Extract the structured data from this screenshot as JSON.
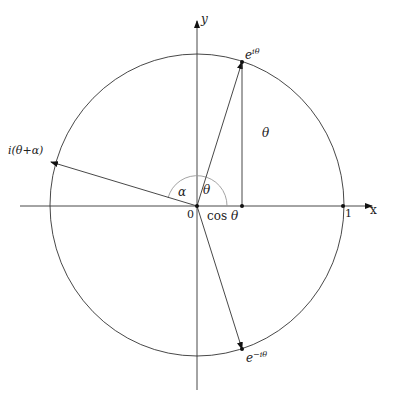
{
  "diagram": {
    "type": "unit-circle-complex-plane",
    "colors": {
      "stroke": "#333333",
      "arc": "#999999",
      "background": "#ffffff"
    },
    "axes": {
      "x_label": "x",
      "y_label": "y",
      "origin_label": "0",
      "unit_label": "1"
    },
    "points": {
      "e_i_theta": {
        "base": "e",
        "exp": "iθ"
      },
      "e_minus_i_theta": {
        "base": "e",
        "exp": "−iθ"
      },
      "i_theta_alpha": "i(θ+α)"
    },
    "angle_labels": {
      "alpha": "α",
      "theta_at_origin": "θ",
      "theta_side": "θ"
    },
    "cos_label": {
      "fn": "cos",
      "arg": "θ"
    }
  }
}
